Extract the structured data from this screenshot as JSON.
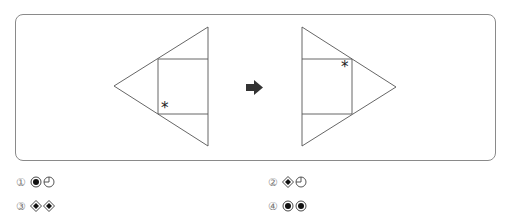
{
  "figure": {
    "left_shape": {
      "description": "triangle pointing left with inscribed square, asterisk at bottom-left inner corner of square",
      "marker": "*"
    },
    "arrow": "right-arrow",
    "right_shape": {
      "description": "triangle pointing right with inscribed square, asterisk at top-right inner corner of square",
      "marker": "*"
    }
  },
  "options": [
    {
      "number": "①",
      "symbols": [
        "circle-filled-dot",
        "quarter-circle-clock"
      ]
    },
    {
      "number": "②",
      "symbols": [
        "diamond-filled-dot",
        "quarter-circle-clock"
      ]
    },
    {
      "number": "③",
      "symbols": [
        "diamond-filled-dot",
        "diamond-filled-dot"
      ]
    },
    {
      "number": "④",
      "symbols": [
        "circle-filled-dot",
        "circle-filled-dot"
      ]
    }
  ]
}
